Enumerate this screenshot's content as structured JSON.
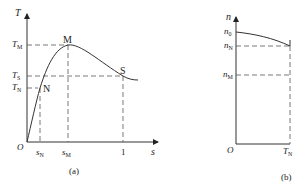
{
  "figure_a": {
    "caption": "(a)",
    "y_axis": {
      "symbol": "T"
    },
    "x_axis": {
      "symbol": "s"
    },
    "origin": "O",
    "y_ticks": [
      {
        "main": "T",
        "sub": "M"
      },
      {
        "main": "T",
        "sub": "S"
      },
      {
        "main": "T",
        "sub": "N"
      }
    ],
    "x_ticks": [
      {
        "main": "s",
        "sub": "N"
      },
      {
        "main": "s",
        "sub": "M"
      },
      {
        "main": "1",
        "sub": ""
      }
    ],
    "points": {
      "M": "M",
      "S": "S",
      "N": "N"
    }
  },
  "figure_b": {
    "caption": "(b)",
    "y_axis": {
      "symbol": "n"
    },
    "origin": "O",
    "y_ticks": [
      {
        "main": "n",
        "sub": "0"
      },
      {
        "main": "n",
        "sub": "N"
      },
      {
        "main": "n",
        "sub": "M"
      }
    ],
    "x_ticks": [
      {
        "main": "T",
        "sub": "N"
      }
    ]
  },
  "colors": {
    "line": "#333333",
    "text": "#222222",
    "background": "#ffffff"
  }
}
